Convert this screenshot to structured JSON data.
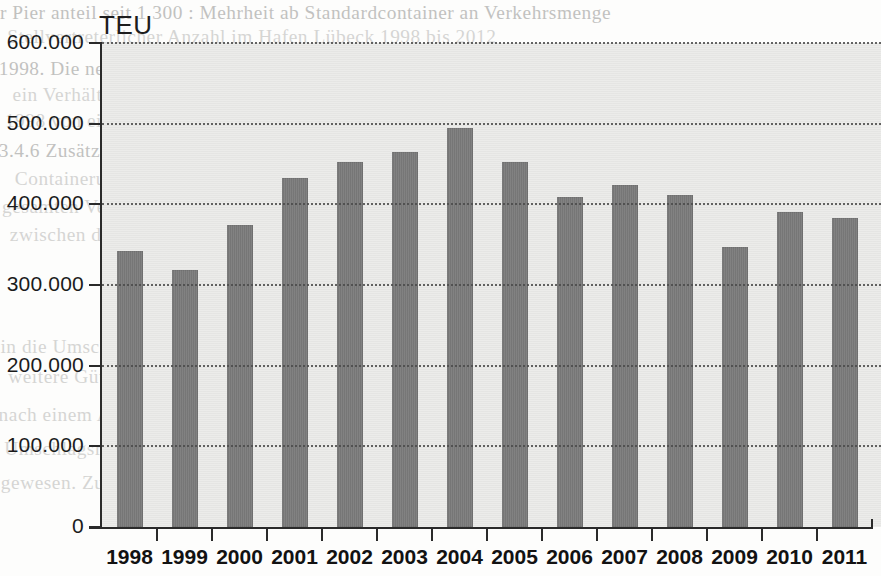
{
  "chart_data": {
    "type": "bar",
    "title": "",
    "ylabel": "TEU",
    "xlabel": "",
    "categories": [
      "1998",
      "1999",
      "2000",
      "2001",
      "2002",
      "2003",
      "2004",
      "2005",
      "2006",
      "2007",
      "2008",
      "2009",
      "2010",
      "2011"
    ],
    "values": [
      342000,
      319000,
      374000,
      433000,
      452000,
      465000,
      495000,
      452000,
      409000,
      424000,
      412000,
      347000,
      390000,
      383000
    ],
    "ylim": [
      0,
      600000
    ],
    "ytick_values": [
      0,
      100000,
      200000,
      300000,
      400000,
      500000,
      600000
    ],
    "ytick_labels": [
      "0",
      "100.000",
      "200.000",
      "300.000",
      "400.000",
      "500.000",
      "600.000"
    ],
    "grid": true,
    "grid_axis": "y",
    "grid_style": "dotted",
    "legend": false,
    "legend_position": "none",
    "bar_color": "#7b7b7b",
    "plot_background_color": "#e9e9e7",
    "axis_color": "#2a2a2a"
  },
  "page": {
    "background_color": "#fdfdfc",
    "ghost_text": [
      "r Pier anteil seit 1 300 : Mehrheit ab Standardcontainer an Verkehrsmenge",
      "Stellvertreterlicher Anzahl im Hafen Lübeck 1998 bis 2012",
      "1998. Die neue Terminals nach Kiel deponiert 1. Betrachten wird",
      "ein Verhältnis, von nun 2,6 - und wieder zwei Hafenterminal in den",
      "1998 von einem direkt - wird am Niveau von dem Jahr 2011 an",
      "3.4.6 Zusätzlich über die Container-Schiffe angerechnet See, den",
      "Containerumschlag hat in den nächsten drei Jahren weiter in der",
      "gesamten Verkehr und in der Umschlag seit Jahren gesteigert. Die Strecke",
      "zwischen denen auf der Basis des Umschlags von 70.000 auf 422.000 zurück",
      "in die Umschlagsmenge eine Container-Terminal in der Ostsee-Fahrt",
      "weitere Güter und in der Kategorie des Seehafens an den Konzern wird",
      "nach einem Anstieg um rund 2,7 % eine Stelle im Jahr von etwa 30",
      "Umschlagsmenge. Im Jahr 2009 waren es noch 1,4 Millionen insgesamt",
      "gewesen. Zu einem Jahr von ca. 9,2 % in der Gesamtmenge der"
    ]
  }
}
